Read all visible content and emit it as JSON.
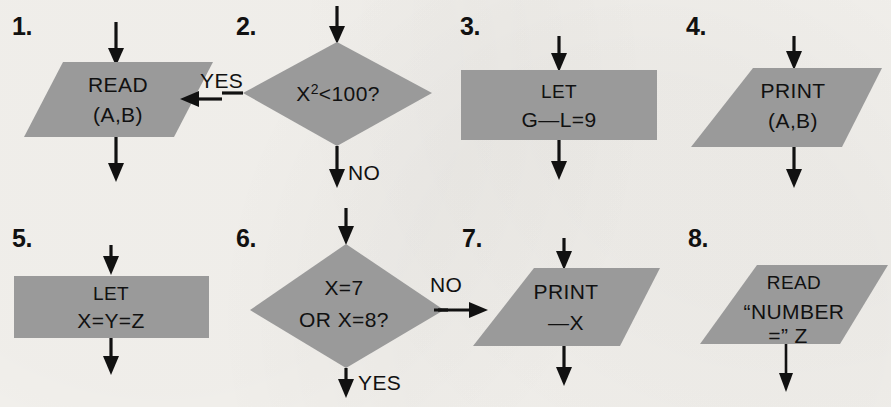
{
  "page": {
    "background_color": "#f5f3ef",
    "shape_fill_color": "#9a9a9a",
    "ink_color": "#111111",
    "columns": 4,
    "rows": 2
  },
  "items": [
    {
      "number": "1.",
      "shape": "parallelogram",
      "lines": [
        "READ",
        "(A,B)"
      ],
      "arrow_in_top": true,
      "arrow_out_bottom": true,
      "side_arrow": {
        "label": "YES",
        "direction": "left",
        "side": "right"
      }
    },
    {
      "number": "2.",
      "shape": "diamond",
      "lines": [
        "X²<100?"
      ],
      "arrow_in_top": true,
      "arrow_out_bottom": true,
      "bottom_label": "NO",
      "side_arrow": {
        "label": "YES",
        "direction": "left",
        "side": "left"
      }
    },
    {
      "number": "3.",
      "shape": "rectangle",
      "lines": [
        "LET",
        "G—L=9"
      ],
      "arrow_in_top": true,
      "arrow_out_bottom": true
    },
    {
      "number": "4.",
      "shape": "parallelogram",
      "lines": [
        "PRINT",
        "(A,B)"
      ],
      "arrow_in_top": true,
      "arrow_out_bottom": true
    },
    {
      "number": "5.",
      "shape": "rectangle",
      "lines": [
        "LET",
        "X=Y=Z"
      ],
      "arrow_in_top": true,
      "arrow_out_bottom": true
    },
    {
      "number": "6.",
      "shape": "diamond",
      "lines": [
        "X=7",
        "OR  X=8?"
      ],
      "arrow_in_top": true,
      "arrow_out_bottom": true,
      "bottom_label": "YES",
      "side_arrow": {
        "label": "NO",
        "direction": "right",
        "side": "right"
      }
    },
    {
      "number": "7.",
      "shape": "parallelogram",
      "lines": [
        "PRINT",
        "—X"
      ],
      "arrow_in_top": true,
      "arrow_out_bottom": true,
      "side_arrow": {
        "label": "NO",
        "direction": "right",
        "side": "left"
      }
    },
    {
      "number": "8.",
      "shape": "parallelogram",
      "lines": [
        "READ",
        "“NUMBER",
        "=”  Z"
      ],
      "arrow_in_top": false,
      "arrow_out_bottom": true
    }
  ]
}
